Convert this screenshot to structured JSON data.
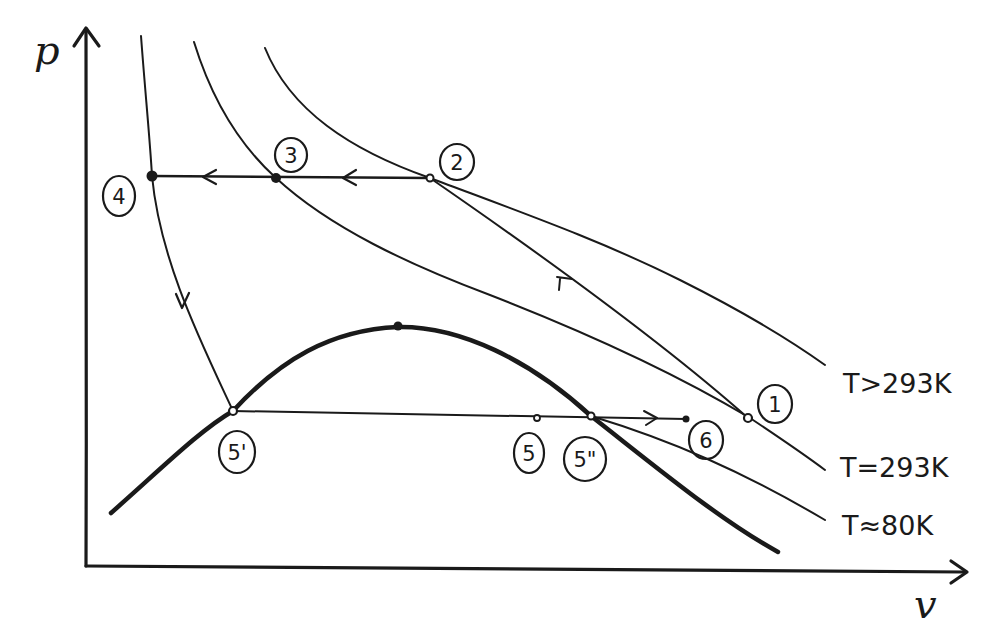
{
  "diagram": {
    "type": "p-v diagram (hand-drawn, gas liquefaction cycle)",
    "axes": {
      "y_label": "p",
      "x_label": "v"
    },
    "isotherms": [
      {
        "id": "t_above_293",
        "label": "T>293K"
      },
      {
        "id": "t_293",
        "label": "T=293K"
      },
      {
        "id": "t_80",
        "label": "T≈80K"
      }
    ],
    "saturation_dome": {
      "label": "",
      "critical_point": true
    },
    "states": [
      {
        "id": "1",
        "label": "1"
      },
      {
        "id": "2",
        "label": "2"
      },
      {
        "id": "3",
        "label": "3"
      },
      {
        "id": "4",
        "label": "4"
      },
      {
        "id": "5p",
        "label": "5'"
      },
      {
        "id": "5",
        "label": "5"
      },
      {
        "id": "5pp",
        "label": "5\""
      },
      {
        "id": "6",
        "label": "6"
      }
    ],
    "processes": [
      {
        "from": "1",
        "to": "2",
        "description": "compression along line (arrow toward 2)"
      },
      {
        "from": "2",
        "to": "3",
        "description": "isobaric cooling (arrow left)"
      },
      {
        "from": "3",
        "to": "4",
        "description": "isobaric cooling (arrow left)"
      },
      {
        "from": "4",
        "to": "5'",
        "description": "expansion (arrow down)"
      },
      {
        "from": "5'",
        "to": "6",
        "description": "horizontal line through 5 and 5\" (arrow right)"
      }
    ]
  }
}
